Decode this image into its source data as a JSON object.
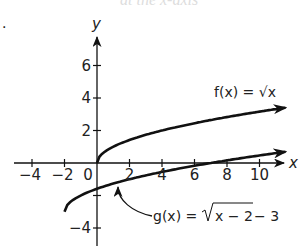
{
  "header": {
    "cropped_text": "at the x-axis",
    "bullet": "."
  },
  "chart_data": {
    "type": "line",
    "title": "",
    "xlabel": "x",
    "ylabel": "y",
    "xlim": [
      -5,
      11.5
    ],
    "ylim": [
      -5,
      7.5
    ],
    "grid": false,
    "x_ticks": [
      -4,
      -2,
      0,
      2,
      4,
      6,
      8,
      10
    ],
    "x_tick_labels": [
      "−4",
      "−2",
      "0",
      "2",
      "4",
      "6",
      "8",
      "10"
    ],
    "y_ticks": [
      6,
      4,
      2,
      -2,
      -4
    ],
    "y_tick_labels": [
      "6",
      "4",
      "2",
      "",
      "−4"
    ],
    "series": [
      {
        "name": "f(x) = √x",
        "label": "f(x) = √x",
        "x": [
          0,
          0.25,
          1,
          2,
          4,
          6,
          8,
          10,
          11.5
        ],
        "values": [
          0,
          0.5,
          1,
          1.41,
          2,
          2.45,
          2.83,
          3.16,
          3.39
        ],
        "arrow_end": true
      },
      {
        "name": "g(x) = √(x − 2) − 3",
        "label_parts": [
          "g(x) =",
          "x − 2",
          " − 3"
        ],
        "x": [
          -2,
          -1.75,
          -1,
          0,
          2,
          4,
          6,
          8,
          10,
          11.5
        ],
        "values": [
          -3,
          -2.5,
          -2,
          -1.59,
          -1,
          -0.55,
          -0.17,
          0.16,
          0.46,
          0.67
        ],
        "arrow_end": true
      }
    ],
    "annotations": [
      {
        "text": "f(x) = √x",
        "near": "upper curve end"
      },
      {
        "text": "g(x) = √(x − 2) − 3",
        "with_arrow_to": "lower curve near x=1"
      }
    ]
  }
}
